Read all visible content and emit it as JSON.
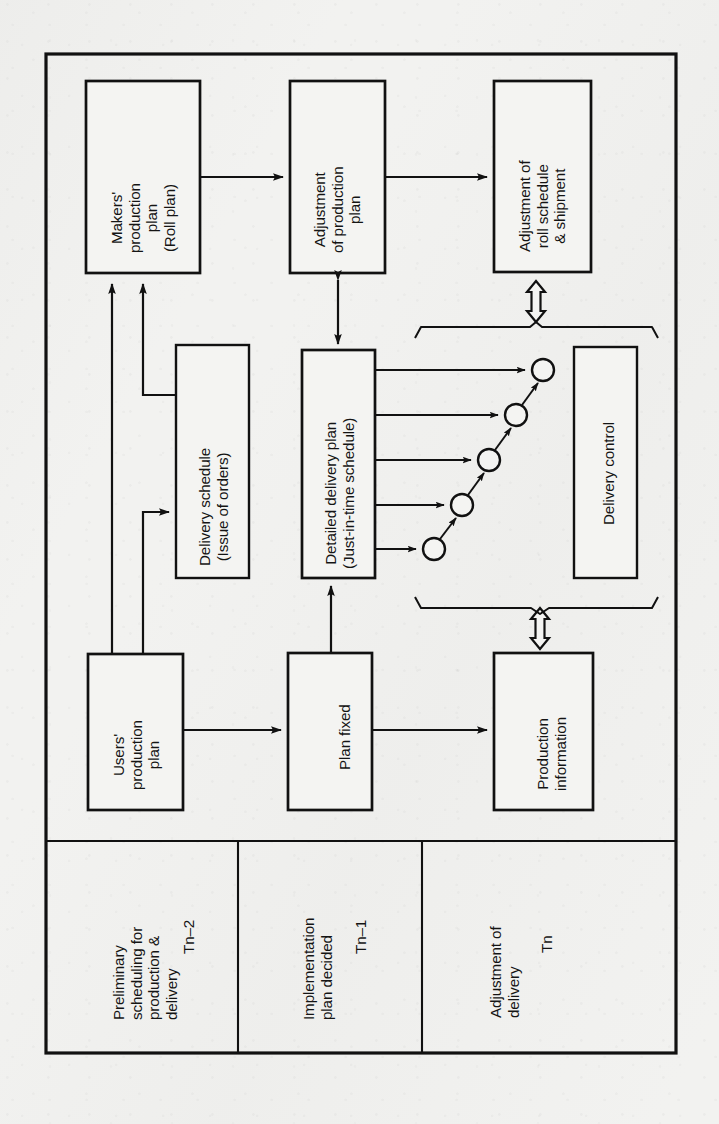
{
  "figure": {
    "type": "flow-diagram",
    "orientation": "rotated-90-ccw",
    "frame_color": "#111111",
    "paper_color": "#f2f2f0"
  },
  "boxes": [
    {
      "id": "makers-production-plan",
      "lines": [
        "Makers'",
        "production",
        "plan",
        "(Roll plan)"
      ],
      "x": 86,
      "y": 81,
      "w": 114,
      "h": 192
    },
    {
      "id": "adjustment-of-production-plan",
      "lines": [
        "Adjustment",
        "of production",
        "plan"
      ],
      "x": 290,
      "y": 81,
      "w": 95,
      "h": 192
    },
    {
      "id": "adjustment-of-roll-schedule-shipment",
      "lines": [
        "Adjustment of",
        "roll schedule",
        "& shipment"
      ],
      "x": 494,
      "y": 81,
      "w": 97,
      "h": 191
    },
    {
      "id": "delivery-schedule",
      "lines": [
        "Delivery schedule",
        "(Issue of orders)"
      ],
      "x": 176,
      "y": 345,
      "w": 73,
      "h": 233
    },
    {
      "id": "detailed-delivery-plan",
      "lines": [
        "Detailed delivery plan",
        "(Just-in-time schedule)"
      ],
      "x": 302,
      "y": 350,
      "w": 73,
      "h": 228
    },
    {
      "id": "delivery-control",
      "lines": [
        "Delivery control"
      ],
      "x": 574,
      "y": 347,
      "w": 63,
      "h": 231
    },
    {
      "id": "users-production-plan",
      "lines": [
        "Users'",
        "production",
        "plan"
      ],
      "x": 88,
      "y": 654,
      "w": 95,
      "h": 156
    },
    {
      "id": "plan-fixed",
      "lines": [
        "Plan fixed"
      ],
      "x": 288,
      "y": 653,
      "w": 84,
      "h": 157
    },
    {
      "id": "production-information",
      "lines": [
        "Production",
        "information"
      ],
      "x": 494,
      "y": 653,
      "w": 99,
      "h": 157
    }
  ],
  "phases": [
    {
      "id": "phase-preliminary",
      "lines": [
        "Preliminary",
        "scheduling for",
        "production &",
        "delivery"
      ],
      "time": "Tn–2",
      "cell": {
        "x": 46,
        "y": 841,
        "w": 192,
        "h": 212
      }
    },
    {
      "id": "phase-implementation",
      "lines": [
        "Implementation",
        "plan decided"
      ],
      "time": "Tn–1",
      "cell": {
        "x": 238,
        "y": 841,
        "w": 184,
        "h": 212
      }
    },
    {
      "id": "phase-adjustment",
      "lines": [
        "Adjustment of",
        "delivery"
      ],
      "time": "Tn",
      "cell": {
        "x": 422,
        "y": 841,
        "w": 254,
        "h": 212
      }
    }
  ],
  "network": {
    "label": "just-in-time-node-chain",
    "node_count": 5,
    "node_radius": 11,
    "nodes": [
      {
        "cx": 434,
        "cy": 549
      },
      {
        "cx": 462,
        "cy": 505
      },
      {
        "cx": 489,
        "cy": 460
      },
      {
        "cx": 516,
        "cy": 415
      },
      {
        "cx": 543,
        "cy": 370
      }
    ]
  },
  "connectors": [
    {
      "id": "makers-to-adjustment-production",
      "kind": "single-arrow"
    },
    {
      "id": "adjustment-production-to-adjustment-roll",
      "kind": "single-arrow"
    },
    {
      "id": "adjustment-production-to-detailed-plan",
      "kind": "double-headed-arrow"
    },
    {
      "id": "adjustment-roll-to-delivery-group",
      "kind": "hollow-double-arrow"
    },
    {
      "id": "delivery-group-to-production-information",
      "kind": "hollow-double-arrow"
    },
    {
      "id": "delivery-schedule-to-makers",
      "kind": "single-arrow"
    },
    {
      "id": "users-plan-to-makers",
      "kind": "single-arrow"
    },
    {
      "id": "users-plan-to-delivery-schedule",
      "kind": "single-arrow"
    },
    {
      "id": "users-plan-to-plan-fixed",
      "kind": "single-arrow"
    },
    {
      "id": "plan-fixed-to-detailed-plan",
      "kind": "single-arrow"
    },
    {
      "id": "plan-fixed-to-production-information",
      "kind": "single-arrow"
    },
    {
      "id": "detailed-plan-to-nodes",
      "kind": "single-arrow",
      "count": 5
    },
    {
      "id": "node-to-node-chain",
      "kind": "single-arrow",
      "count": 4
    }
  ],
  "braces": [
    {
      "id": "upper-brace",
      "orientation": "horizontal"
    },
    {
      "id": "lower-brace",
      "orientation": "horizontal"
    }
  ]
}
